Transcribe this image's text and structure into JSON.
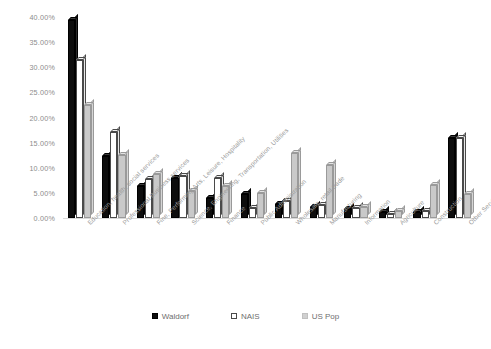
{
  "chart_data": {
    "type": "bar",
    "title": "",
    "xlabel": "",
    "ylabel": "",
    "ylim": [
      0,
      40
    ],
    "grid": false,
    "legend_position": "bottom",
    "y_ticks": [
      "0.00%",
      "5.00%",
      "10.00%",
      "15.00%",
      "20.00%",
      "25.00%",
      "30.00%",
      "35.00%",
      "40.00%"
    ],
    "y_tick_values": [
      0,
      5,
      10,
      15,
      20,
      25,
      30,
      35,
      40
    ],
    "categories": [
      "Education, health, social services",
      "Professional Business services",
      "Fine, Performing Arts, Leisure, Hospitality",
      "Science, Engineering, Transportation, Utilities",
      "Finance",
      "Public Administration",
      "Wholesale, retail trade",
      "Manufacturing",
      "Information",
      "Agriculture",
      "Construction",
      "Other Services"
    ],
    "series": [
      {
        "name": "Waldorf",
        "color": "#0d0d0d",
        "values": [
          39.5,
          12.3,
          6.3,
          8.0,
          4.0,
          4.8,
          2.7,
          2.2,
          1.7,
          1.2,
          1.2,
          16.0
        ]
      },
      {
        "name": "NAIS",
        "color": "#ffffff",
        "values": [
          31.5,
          17.2,
          7.7,
          8.3,
          8.0,
          2.0,
          3.3,
          2.5,
          2.0,
          0.8,
          1.3,
          16.0
        ]
      },
      {
        "name": "US Pop",
        "color": "#c9c9c9",
        "values": [
          22.5,
          12.5,
          8.8,
          5.3,
          6.4,
          5.0,
          13.0,
          10.5,
          2.2,
          1.4,
          6.6,
          4.8
        ]
      }
    ]
  },
  "legend": {
    "items": [
      {
        "label": "Waldorf"
      },
      {
        "label": "NAIS"
      },
      {
        "label": "US Pop"
      }
    ]
  }
}
